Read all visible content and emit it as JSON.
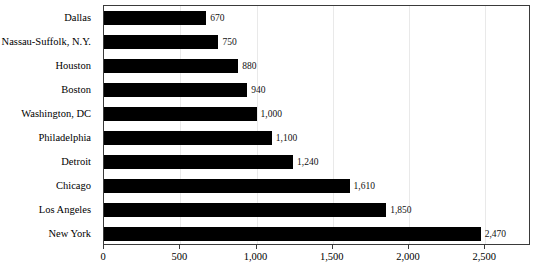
{
  "chart_data": {
    "type": "bar",
    "orientation": "horizontal",
    "title": "",
    "subtitle": "",
    "xlabel": "",
    "ylabel": "",
    "xlim": [
      0,
      2800
    ],
    "grid": true,
    "legend": false,
    "categories": [
      "Dallas",
      "Nassau-Suffolk, N.Y.",
      "Houston",
      "Boston",
      "Washington, DC",
      "Philadelphia",
      "Detroit",
      "Chicago",
      "Los Angeles",
      "New York"
    ],
    "values": [
      670,
      750,
      880,
      940,
      1000,
      1100,
      1240,
      1610,
      1850,
      2470
    ],
    "data_labels": [
      "670",
      "750",
      "880",
      "940",
      "1,000",
      "1,100",
      "1,240",
      "1,610",
      "1,850",
      "2,470"
    ],
    "xticks": [
      0,
      500,
      1000,
      1500,
      2000,
      2500
    ],
    "xtick_labels": [
      "0",
      "500",
      "1,000",
      "1,500",
      "2,000",
      "2,500"
    ],
    "bar_color": "#000000",
    "grid_color": "#e9e9e9",
    "axis_color": "#3a3a3a",
    "background_color": "#ffffff"
  }
}
